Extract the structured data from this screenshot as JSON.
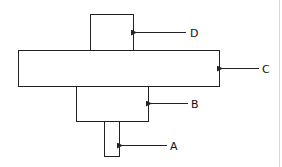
{
  "diagram": {
    "parts": [
      {
        "id": "A",
        "label": "A"
      },
      {
        "id": "B",
        "label": "B"
      },
      {
        "id": "C",
        "label": "C"
      },
      {
        "id": "D",
        "label": "D"
      }
    ],
    "colors": {
      "stroke": "#222222",
      "fill": "#ffffff",
      "border": "#d8d8d8"
    }
  }
}
